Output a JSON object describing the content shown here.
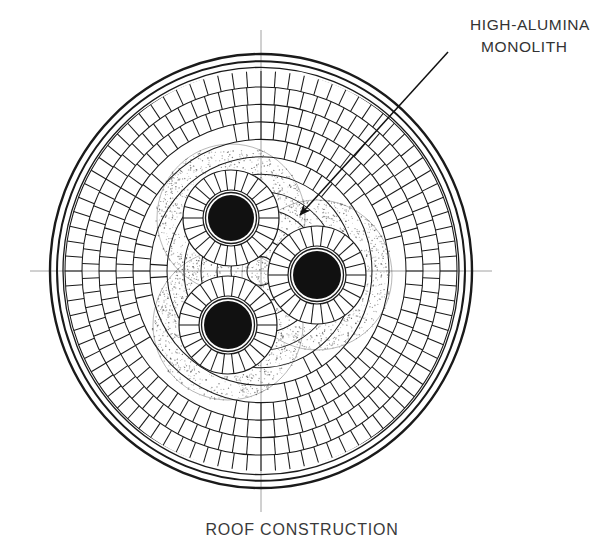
{
  "figure": {
    "caption": "ROOF CONSTRUCTION",
    "annotation_line1": "HIGH-ALUMINA",
    "annotation_line2": "MONOLITH",
    "stroke_color": "#1a1a1a",
    "fill_color": "#ffffff",
    "electrode_color": "#111111",
    "stipple_color": "#555555",
    "centerline_color": "#8a8a8a"
  },
  "chart_data": {
    "type": "diagram",
    "title": "ROOF CONSTRUCTION",
    "annotations": [
      {
        "label": "HIGH-ALUMINA MONOLITH",
        "text_x": 470,
        "text_y": 30,
        "leader_start_x": 448,
        "leader_start_y": 52,
        "leader_end_x": 300,
        "leader_end_y": 215
      }
    ],
    "roof": {
      "center_x": 261,
      "center_y": 271,
      "outer_shell_rx": 211,
      "outer_shell_ry": 217,
      "shell_gap": 7,
      "ring_count": 11,
      "ring_bands_rx": [
        196,
        179,
        162,
        145,
        128,
        111,
        94,
        77,
        60,
        44,
        30
      ],
      "brick_counts": [
        84,
        78,
        72,
        66,
        60,
        54,
        48,
        42,
        36,
        30,
        24
      ]
    },
    "electrode_holes": [
      {
        "name": "electrode-upper-left",
        "cx": 231,
        "cy": 218,
        "core_r": 23,
        "ring_outer_r": 48,
        "ring_inner_r": 28,
        "brick_count": 26
      },
      {
        "name": "electrode-right",
        "cx": 317,
        "cy": 275,
        "core_r": 24,
        "ring_outer_r": 49,
        "ring_inner_r": 29,
        "brick_count": 26
      },
      {
        "name": "electrode-lower-left",
        "cx": 228,
        "cy": 325,
        "core_r": 24,
        "ring_outer_r": 49,
        "ring_inner_r": 29,
        "brick_count": 26
      }
    ],
    "centerlines": {
      "horizontal_y": 271,
      "horizontal_x1": 30,
      "horizontal_x2": 492,
      "vertical_x": 261,
      "vertical_y1": 30,
      "vertical_y2": 512
    }
  }
}
